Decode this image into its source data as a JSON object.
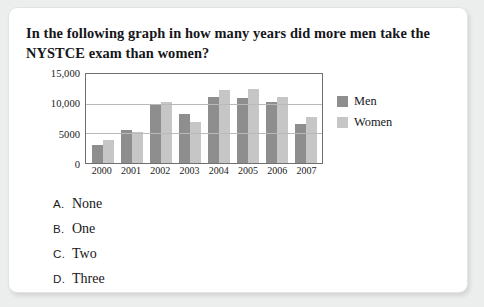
{
  "question": {
    "text": "In the following graph in how many years did more men take the NYSTCE exam than women?"
  },
  "options": [
    {
      "letter": "A.",
      "text": "None"
    },
    {
      "letter": "B.",
      "text": "One"
    },
    {
      "letter": "C.",
      "text": "Two"
    },
    {
      "letter": "D.",
      "text": "Three"
    }
  ],
  "colors": {
    "men": "#8e8e8e",
    "women": "#c6c6c6",
    "card": "#ffffff",
    "page": "#eceded",
    "axis": "#6f6f6f",
    "grid": "#b9b9b9"
  },
  "chart_data": {
    "type": "bar",
    "title": "",
    "xlabel": "",
    "ylabel": "",
    "categories": [
      "2000",
      "2001",
      "2002",
      "2003",
      "2004",
      "2005",
      "2006",
      "2007"
    ],
    "series": [
      {
        "name": "Men",
        "values": [
          3000,
          5500,
          9700,
          8200,
          11200,
          11000,
          10300,
          6500
        ]
      },
      {
        "name": "Women",
        "values": [
          3800,
          5200,
          10200,
          6900,
          12300,
          12400,
          11100,
          7800
        ]
      }
    ],
    "ylim": [
      0,
      15000
    ],
    "yticks": [
      0,
      5000,
      10000,
      15000
    ],
    "ytick_labels": [
      "0",
      "5000",
      "10,000",
      "15,000"
    ],
    "grid": true,
    "legend_position": "right",
    "legend": [
      "Men",
      "Women"
    ]
  }
}
